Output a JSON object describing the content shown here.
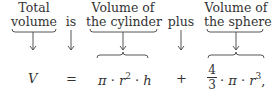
{
  "labels": {
    "total_volume": [
      "Total",
      "volume"
    ],
    "is": "is",
    "volume_cylinder": [
      "Volume of",
      "the cylinder"
    ],
    "plus": "plus",
    "volume_sphere": [
      "Volume of",
      "the sphere"
    ]
  },
  "equation": {
    "lhs": "V",
    "equals": "=",
    "cylinder": {
      "pi": "π",
      "dot": "·",
      "r": "r",
      "r_exp": "2",
      "h": "h"
    },
    "plus": "+",
    "sphere": {
      "num": "4",
      "den": "3",
      "pi": "π",
      "dot": "·",
      "r": "r",
      "r_exp": "3",
      "trail": ","
    }
  }
}
